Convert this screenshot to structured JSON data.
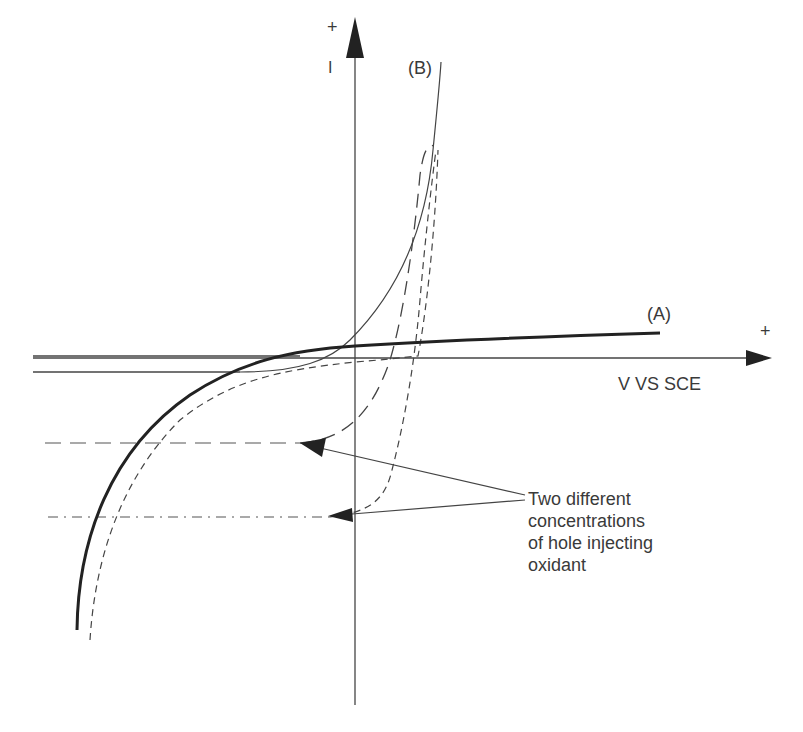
{
  "diagram": {
    "type": "current-voltage curves (semiconductor electrode)",
    "y_axis": {
      "label": "I",
      "positive_sign": "+"
    },
    "x_axis": {
      "label": "V VS SCE",
      "positive_sign": "+"
    },
    "curves": [
      {
        "id": "A",
        "label": "(A)",
        "style": "thick solid"
      },
      {
        "id": "B",
        "label": "(B)",
        "style": "thin solid"
      },
      {
        "id": "B1",
        "label": "",
        "style": "long dashed",
        "limit": "upper plateau"
      },
      {
        "id": "B2",
        "label": "",
        "style": "short dashed",
        "limit": "lower plateau"
      }
    ],
    "annotation": {
      "lines": [
        "Two different",
        "concentrations",
        "of hole injecting",
        "oxidant"
      ]
    }
  }
}
